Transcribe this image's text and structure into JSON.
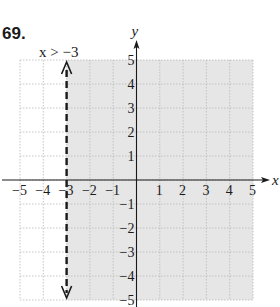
{
  "problem": {
    "number": "69."
  },
  "chart_data": {
    "type": "inequality-graph",
    "title": "",
    "inequality_label": "x > −3",
    "inequality": {
      "variable": "x",
      "operator": ">",
      "value": -3,
      "boundary": "dashed",
      "shaded": "right"
    },
    "xlabel": "x",
    "ylabel": "y",
    "xlim": [
      -5,
      5
    ],
    "ylim": [
      -5,
      5
    ],
    "x_ticks": [
      "−5",
      "−4",
      "−3",
      "−2",
      "−1",
      "1",
      "2",
      "3",
      "4",
      "5"
    ],
    "y_ticks": [
      "5",
      "4",
      "3",
      "2",
      "1",
      "−1",
      "−2",
      "−3",
      "−4",
      "−5"
    ],
    "grid": true,
    "colors": {
      "shade": "#e6e6e6",
      "grid": "#b8b8b8",
      "axis": "#1a1a1a",
      "boundary": "#1a1a1a"
    }
  }
}
